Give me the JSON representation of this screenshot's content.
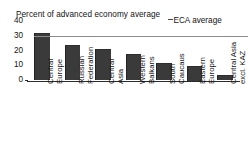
{
  "chart_data": {
    "type": "bar",
    "title": "Percent of advanced economy average",
    "xlabel": "",
    "ylabel": "",
    "ylim": [
      0,
      40
    ],
    "yticks": [
      0,
      10,
      20,
      30,
      40
    ],
    "grid": false,
    "legend_position": "top-right",
    "categories": [
      "Central Europe",
      "Russian Federation",
      "Central Asia",
      "Western Balkans",
      "South Caucaus",
      "Eastern Europe",
      "Central Asia excl. KAZ"
    ],
    "category_lines": [
      [
        "Central",
        "Europe"
      ],
      [
        "Russian",
        "Federation"
      ],
      [
        "Central",
        "Asia"
      ],
      [
        "Western",
        "Balkans"
      ],
      [
        "South",
        "Caucaus"
      ],
      [
        "Eastern",
        "Europe"
      ],
      [
        "Central Asia",
        "excl. KAZ"
      ]
    ],
    "values": [
      32,
      24,
      21.5,
      18,
      12,
      10,
      3.5
    ],
    "series": [
      {
        "name": "Percent of advanced economy average",
        "values": [
          32,
          24,
          21.5,
          18,
          12,
          10,
          3.5
        ]
      }
    ],
    "reference_lines": [
      {
        "label": "ECA average",
        "value": 30,
        "color": "#8c8c8c"
      }
    ],
    "colors": {
      "bar": "#3a3a3a",
      "axis": "#2b2b2b",
      "reference_line": "#8c8c8c",
      "text": "#141414"
    }
  },
  "legend": {
    "eca_label": "ECA average"
  }
}
